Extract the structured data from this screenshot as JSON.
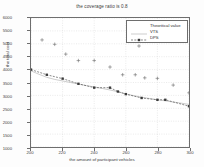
{
  "chart_data": {
    "type": "line",
    "title": "the coverage ratio is 0.8",
    "xlabel": "the amount of participant vehicles",
    "ylabel": "the total cost",
    "xlim": [
      200,
      300
    ],
    "ylim": [
      1000,
      6000
    ],
    "xticks": [
      200,
      220,
      240,
      260,
      280,
      300
    ],
    "yticks": [
      1000,
      1500,
      2000,
      2500,
      3000,
      3500,
      4000,
      4500,
      5000,
      5500,
      6000
    ],
    "grid": true,
    "legend_position": "top-right",
    "legend": [
      "Theoritical value",
      "VTS",
      "DPS"
    ],
    "series": [
      {
        "name": "Theoritical value",
        "style": "solid-thin",
        "color": "#9a9a9a",
        "x": [
          200,
          205,
          210,
          215,
          220,
          225,
          230,
          235,
          240,
          245,
          250,
          255,
          260,
          265,
          270,
          275,
          280,
          285,
          290,
          295,
          300
        ],
        "values": [
          3950,
          3820,
          3700,
          3620,
          3560,
          3500,
          3440,
          3380,
          3330,
          3270,
          3210,
          3140,
          3060,
          2990,
          2930,
          2880,
          2830,
          2790,
          2740,
          2700,
          2650
        ]
      },
      {
        "name": "VTS",
        "style": "dashed-marker",
        "color": "#3a3a3a",
        "marker": "square",
        "x": [
          200,
          210,
          220,
          230,
          240,
          250,
          255,
          260,
          270,
          280,
          285,
          300
        ],
        "values": [
          4000,
          3800,
          3650,
          3450,
          3300,
          3300,
          3150,
          3050,
          2900,
          2830,
          2830,
          2580
        ]
      },
      {
        "name": "DPS",
        "style": "scatter",
        "color": "#6a6a6a",
        "marker": "plus",
        "x": [
          207,
          215,
          222,
          230,
          240,
          250,
          258,
          266,
          272,
          280,
          290,
          300
        ],
        "values": [
          5150,
          4980,
          4600,
          4350,
          4350,
          4100,
          3800,
          3800,
          3680,
          3660,
          3400,
          3100
        ]
      }
    ]
  }
}
